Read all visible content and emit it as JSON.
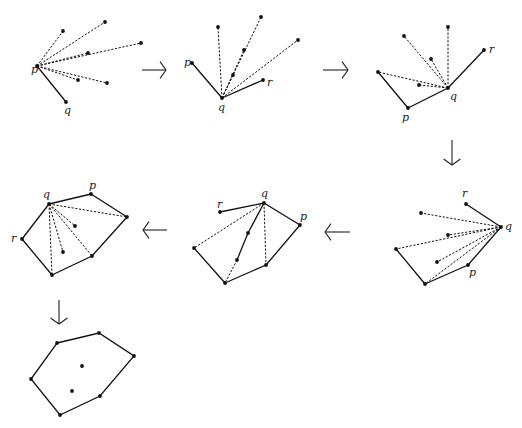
{
  "labels": {
    "p": "p",
    "q": "q",
    "r": "r"
  },
  "panels": [
    {
      "id": "step-1",
      "vertices": {
        "p": [
          37,
          66
        ],
        "q": [
          66,
          102
        ]
      },
      "points": [
        [
          63,
          31
        ],
        [
          105,
          22
        ],
        [
          141,
          43
        ],
        [
          88,
          53
        ],
        [
          107,
          83
        ],
        [
          78,
          80
        ]
      ],
      "solid": [
        [
          "p",
          "q"
        ]
      ],
      "dashed_from": "p",
      "labels": [
        {
          "k": "p",
          "at": [
            31,
            73
          ]
        },
        {
          "k": "q",
          "at": [
            64,
            114
          ]
        }
      ]
    },
    {
      "id": "step-2",
      "vertices": {
        "p": [
          192,
          63
        ],
        "q": [
          222,
          98
        ],
        "r": [
          263,
          80
        ]
      },
      "points": [
        [
          218,
          27
        ],
        [
          261,
          17
        ],
        [
          298,
          40
        ],
        [
          244,
          50
        ],
        [
          233,
          75
        ]
      ],
      "solid": [
        [
          "p",
          "q"
        ],
        [
          "q",
          "r"
        ]
      ],
      "dashed_from": "q",
      "labels": [
        {
          "k": "p",
          "at": [
            184,
            66
          ]
        },
        {
          "k": "q",
          "at": [
            218,
            111
          ]
        },
        {
          "k": "r",
          "at": [
            267,
            86
          ]
        }
      ]
    },
    {
      "id": "step-3",
      "vertices": {
        "p": [
          408,
          108
        ],
        "q": [
          448,
          88
        ],
        "r": [
          484,
          50
        ],
        "s": [
          378,
          72
        ]
      },
      "points": [
        [
          404,
          36
        ],
        [
          448,
          27
        ],
        [
          431,
          59
        ],
        [
          419,
          85
        ]
      ],
      "solid": [
        [
          "s",
          "p"
        ],
        [
          "p",
          "q"
        ],
        [
          "q",
          "r"
        ]
      ],
      "dashed_from": "q",
      "dashed_extra": [
        [
          "q",
          "s"
        ]
      ],
      "labels": [
        {
          "k": "p",
          "at": [
            402,
            121
          ]
        },
        {
          "k": "q",
          "at": [
            450,
            100
          ]
        },
        {
          "k": "r",
          "at": [
            489,
            53
          ]
        }
      ]
    },
    {
      "id": "step-4",
      "vertices": {
        "q": [
          501,
          227
        ],
        "r": [
          466,
          204
        ],
        "p": [
          468,
          265
        ],
        "b": [
          425,
          284
        ],
        "l": [
          396,
          249
        ]
      },
      "points": [
        [
          421,
          213
        ],
        [
          448,
          235
        ],
        [
          437,
          262
        ]
      ],
      "solid": [
        [
          "r",
          "q"
        ],
        [
          "q",
          "p"
        ],
        [
          "p",
          "b"
        ],
        [
          "b",
          "l"
        ]
      ],
      "dashed_from": "q",
      "dashed_extra": [
        [
          "q",
          "l"
        ],
        [
          "q",
          "b"
        ]
      ],
      "labels": [
        {
          "k": "r",
          "at": [
            462,
            197
          ]
        },
        {
          "k": "q",
          "at": [
            505,
            230
          ]
        },
        {
          "k": "p",
          "at": [
            469,
            276
          ]
        }
      ]
    },
    {
      "id": "step-5",
      "vertices": {
        "q": [
          264,
          203
        ],
        "r": [
          220,
          212
        ],
        "p": [
          300,
          225
        ],
        "l": [
          194,
          248
        ],
        "b": [
          225,
          283
        ],
        "m": [
          266,
          265
        ],
        "i1": [
          248,
          233
        ],
        "i2": [
          237,
          260
        ]
      },
      "points": [],
      "solid": [
        [
          "r",
          "q"
        ],
        [
          "q",
          "p"
        ],
        [
          "p",
          "m"
        ],
        [
          "m",
          "b"
        ],
        [
          "b",
          "l"
        ],
        [
          "q",
          "i1"
        ],
        [
          "i1",
          "i2"
        ]
      ],
      "dashed_extra": [
        [
          "q",
          "l"
        ],
        [
          "q",
          "m"
        ],
        [
          "i2",
          "b"
        ]
      ],
      "labels": [
        {
          "k": "q",
          "at": [
            261,
            197
          ]
        },
        {
          "k": "r",
          "at": [
            217,
            208
          ]
        },
        {
          "k": "p",
          "at": [
            300,
            220
          ]
        }
      ]
    },
    {
      "id": "step-6",
      "vertices": {
        "q": [
          49,
          204
        ],
        "p": [
          91,
          194
        ],
        "e": [
          127,
          217
        ],
        "m": [
          92,
          256
        ],
        "b": [
          52,
          275
        ],
        "r": [
          22,
          239
        ]
      },
      "points": [
        [
          75,
          226
        ],
        [
          63,
          252
        ]
      ],
      "solid": [
        [
          "r",
          "q"
        ],
        [
          "q",
          "p"
        ],
        [
          "p",
          "e"
        ],
        [
          "e",
          "m"
        ],
        [
          "m",
          "b"
        ],
        [
          "b",
          "r"
        ]
      ],
      "dashed_from": "q",
      "dashed_targets": [
        [
          127,
          217
        ],
        [
          75,
          226
        ],
        [
          63,
          252
        ],
        [
          92,
          256
        ],
        [
          52,
          275
        ]
      ],
      "labels": [
        {
          "k": "q",
          "at": [
            43,
            198
          ]
        },
        {
          "k": "p",
          "at": [
            89,
            189
          ]
        },
        {
          "k": "r",
          "at": [
            11,
            242
          ]
        }
      ]
    },
    {
      "id": "step-7",
      "hull": [
        [
          57,
          343
        ],
        [
          99,
          333
        ],
        [
          134,
          356
        ],
        [
          100,
          396
        ],
        [
          60,
          415
        ],
        [
          31,
          379
        ]
      ],
      "points": [
        [
          82,
          366
        ],
        [
          72,
          391
        ]
      ]
    }
  ],
  "arrows": [
    {
      "dir": "right",
      "from": [
        142,
        70
      ],
      "to": [
        166,
        70
      ]
    },
    {
      "dir": "right",
      "from": [
        323,
        70
      ],
      "to": [
        348,
        70
      ]
    },
    {
      "dir": "down",
      "from": [
        452,
        140
      ],
      "to": [
        452,
        165
      ]
    },
    {
      "dir": "left",
      "from": [
        350,
        232
      ],
      "to": [
        325,
        232
      ]
    },
    {
      "dir": "left",
      "from": [
        167,
        230
      ],
      "to": [
        143,
        230
      ]
    },
    {
      "dir": "down",
      "from": [
        59,
        300
      ],
      "to": [
        59,
        324
      ]
    }
  ]
}
